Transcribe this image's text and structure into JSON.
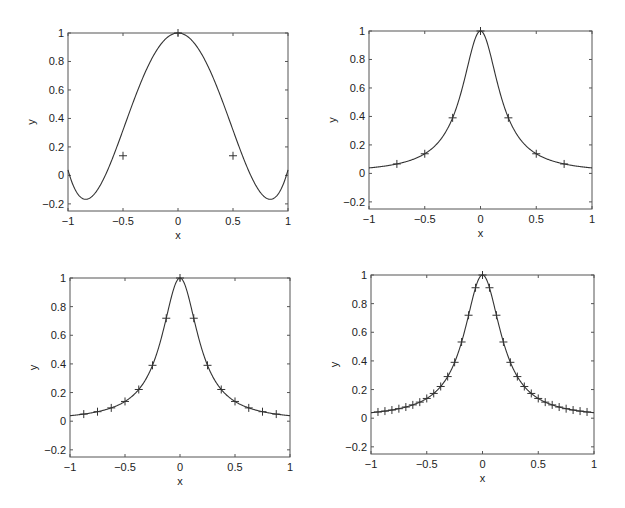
{
  "figure": {
    "background": "#ffffff",
    "line_color": "#333333",
    "axes_color": "#555555"
  },
  "chart_data": [
    {
      "type": "line",
      "panel": "top-left",
      "title": "",
      "xlabel": "x",
      "ylabel": "y",
      "xlim": [
        -1,
        1
      ],
      "ylim": [
        -0.25,
        1
      ],
      "xticks": [
        -1,
        -0.5,
        0,
        0.5,
        1
      ],
      "xtick_labels": [
        "-1",
        "-0.5",
        "0",
        "0.5",
        "1"
      ],
      "yticks": [
        -0.2,
        0,
        0.2,
        0.4,
        0.6,
        0.8,
        1
      ],
      "ytick_labels": [
        "-0.2",
        "0",
        "0.2",
        "0.4",
        "0.6",
        "0.8",
        "1"
      ],
      "grid": false,
      "curve": "interpolating polynomial of 1/(1+25x^2) on 5 equispaced nodes",
      "markers": {
        "symbol": "+",
        "x": [
          -0.5,
          0,
          0.5
        ],
        "y": [
          0.138,
          1.0,
          0.138
        ]
      },
      "box": {
        "left": 68,
        "top": 33,
        "right": 288,
        "bottom": 211
      }
    },
    {
      "type": "line",
      "panel": "top-right",
      "title": "",
      "xlabel": "x",
      "ylabel": "y",
      "xlim": [
        -1,
        1
      ],
      "ylim": [
        -0.25,
        1
      ],
      "xticks": [
        -1,
        -0.5,
        0,
        0.5,
        1
      ],
      "xtick_labels": [
        "-1",
        "-0.5",
        "0",
        "0.5",
        "1"
      ],
      "yticks": [
        -0.2,
        0,
        0.2,
        0.4,
        0.6,
        0.8,
        1
      ],
      "ytick_labels": [
        "-0.2",
        "0",
        "0.2",
        "0.4",
        "0.6",
        "0.8",
        "1"
      ],
      "grid": false,
      "curve": "interpolant of 1/(1+25x^2) on 9 equispaced nodes",
      "markers": {
        "symbol": "+",
        "x": [
          -0.75,
          -0.5,
          -0.25,
          0,
          0.25,
          0.5,
          0.75
        ],
        "y": [
          0.066,
          0.138,
          0.39,
          1.0,
          0.39,
          0.138,
          0.066
        ]
      },
      "box": {
        "left": 369,
        "top": 31,
        "right": 592,
        "bottom": 209
      }
    },
    {
      "type": "line",
      "panel": "bottom-left",
      "title": "",
      "xlabel": "x",
      "ylabel": "y",
      "xlim": [
        -1,
        1
      ],
      "ylim": [
        -0.25,
        1
      ],
      "xticks": [
        -1,
        -0.5,
        0,
        0.5,
        1
      ],
      "xtick_labels": [
        "-1",
        "-0.5",
        "0",
        "0.5",
        "1"
      ],
      "yticks": [
        -0.2,
        0,
        0.2,
        0.4,
        0.6,
        0.8,
        1
      ],
      "ytick_labels": [
        "-0.2",
        "0",
        "0.2",
        "0.4",
        "0.6",
        "0.8",
        "1"
      ],
      "grid": false,
      "curve": "interpolant of 1/(1+25x^2) on 17 equispaced nodes",
      "markers": {
        "symbol": "+",
        "x": [
          -0.875,
          -0.75,
          -0.625,
          -0.5,
          -0.375,
          -0.25,
          -0.125,
          0,
          0.125,
          0.25,
          0.375,
          0.5,
          0.625,
          0.75,
          0.875
        ],
        "y": [
          0.05,
          0.066,
          0.093,
          0.138,
          0.221,
          0.39,
          0.719,
          1.0,
          0.719,
          0.39,
          0.221,
          0.138,
          0.093,
          0.066,
          0.05
        ]
      },
      "box": {
        "left": 70,
        "top": 278,
        "right": 290,
        "bottom": 457
      }
    },
    {
      "type": "line",
      "panel": "bottom-right",
      "title": "",
      "xlabel": "x",
      "ylabel": "y",
      "xlim": [
        -1,
        1
      ],
      "ylim": [
        -0.25,
        1
      ],
      "xticks": [
        -1,
        -0.5,
        0,
        0.5,
        1
      ],
      "xtick_labels": [
        "-1",
        "-0.5",
        "0",
        "0.5",
        "1"
      ],
      "yticks": [
        -0.2,
        0,
        0.2,
        0.4,
        0.6,
        0.8,
        1
      ],
      "ytick_labels": [
        "-0.2",
        "0",
        "0.2",
        "0.4",
        "0.6",
        "0.8",
        "1"
      ],
      "grid": false,
      "curve": "interpolant of 1/(1+25x^2) on 33 equispaced nodes",
      "markers": {
        "symbol": "+",
        "step": 0.0625,
        "x_range": [
          -0.9375,
          0.9375
        ]
      },
      "box": {
        "left": 371,
        "top": 275,
        "right": 594,
        "bottom": 454
      }
    }
  ]
}
